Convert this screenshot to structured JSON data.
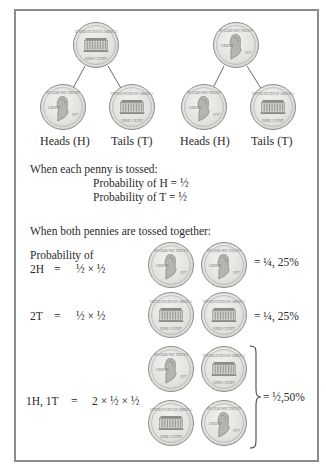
{
  "tree": {
    "left": {
      "root": "tails",
      "children": [
        "heads",
        "tails"
      ],
      "labels": [
        "Heads (H)",
        "Tails (T)"
      ]
    },
    "right": {
      "root": "heads",
      "children": [
        "heads",
        "tails"
      ],
      "labels": [
        "Heads (H)",
        "Tails (T)"
      ]
    }
  },
  "single_toss": {
    "heading": "When each penny is tossed:",
    "line1": "Probability of H = ½",
    "line2": "Probability of T = ½"
  },
  "double_toss": {
    "heading": "When both pennies are tossed together:",
    "rows": [
      {
        "label_top": "Probability of",
        "label": "2H",
        "eq": "=",
        "expr": "½ × ½",
        "coins": [
          "heads",
          "heads"
        ],
        "result": "= ¼, 25%"
      },
      {
        "label": "2T",
        "eq": "=",
        "expr": "½ × ½",
        "coins": [
          "tails",
          "tails"
        ],
        "result": "= ¼, 25%"
      },
      {
        "label": "1H, 1T",
        "eq": "=",
        "expr": "2 × ½ × ½",
        "coins": [
          [
            "heads",
            "tails"
          ],
          [
            "tails",
            "heads"
          ]
        ],
        "result": "= ½,50%"
      }
    ]
  },
  "colors": {
    "border": "#8c8c8c",
    "coin": "#e2e2df",
    "text": "#2a2a2a"
  }
}
